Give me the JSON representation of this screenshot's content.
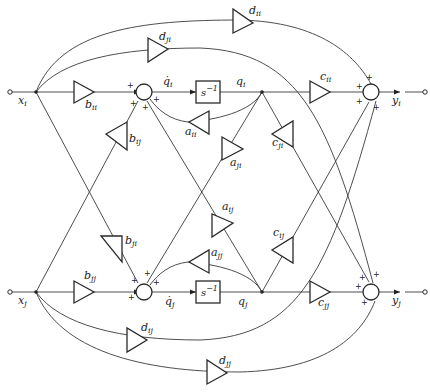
{
  "diagram": {
    "type": "signal-flow block diagram",
    "inputs": [
      {
        "id": "x_i",
        "base": "x",
        "sub": "i"
      },
      {
        "id": "x_j",
        "base": "x",
        "sub": "j"
      }
    ],
    "outputs": [
      {
        "id": "y_i",
        "base": "y",
        "sub": "i"
      },
      {
        "id": "y_j",
        "base": "y",
        "sub": "j"
      }
    ],
    "states": {
      "qdot_i": {
        "base": "q̇",
        "sub": "i"
      },
      "q_i": {
        "base": "q",
        "sub": "i"
      },
      "qdot_j": {
        "base": "q̇",
        "sub": "j"
      },
      "q_j": {
        "base": "q",
        "sub": "j"
      }
    },
    "integrators": {
      "i": {
        "label": "s",
        "exp": "−1"
      },
      "j": {
        "label": "s",
        "exp": "−1"
      }
    },
    "gains": {
      "b_ii": {
        "base": "b",
        "sub": "ii"
      },
      "b_ij": {
        "base": "b",
        "sub": "ij"
      },
      "b_ji": {
        "base": "b",
        "sub": "ji"
      },
      "b_jj": {
        "base": "b",
        "sub": "jj"
      },
      "a_ii": {
        "base": "a",
        "sub": "ii"
      },
      "a_ij": {
        "base": "a",
        "sub": "ij"
      },
      "a_ji": {
        "base": "a",
        "sub": "ji"
      },
      "a_jj": {
        "base": "a",
        "sub": "jj"
      },
      "c_ii": {
        "base": "c",
        "sub": "ii"
      },
      "c_ij": {
        "base": "c",
        "sub": "ij"
      },
      "c_ji": {
        "base": "c",
        "sub": "ji"
      },
      "c_jj": {
        "base": "c",
        "sub": "jj"
      },
      "d_ii": {
        "base": "d",
        "sub": "ii"
      },
      "d_ij": {
        "base": "d",
        "sub": "ij"
      },
      "d_ji": {
        "base": "d",
        "sub": "ji"
      },
      "d_jj": {
        "base": "d",
        "sub": "jj"
      }
    },
    "sign": "+"
  }
}
